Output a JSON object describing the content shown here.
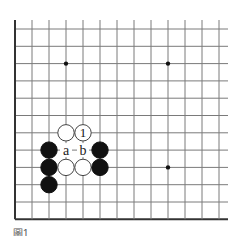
{
  "diagram": {
    "type": "go-board-fragment",
    "grid": {
      "columns": 13,
      "rows": 12,
      "x0": 15,
      "y0": 29,
      "dx": 17,
      "dy": 17.3,
      "open_right": true,
      "open_top": true,
      "line_color": "#7a7a7a",
      "edge_color": "#333333"
    },
    "star_points": [
      {
        "col": 3,
        "row": 2
      },
      {
        "col": 9,
        "row": 2
      },
      {
        "col": 9,
        "row": 8
      }
    ],
    "stones": [
      {
        "col": 3,
        "row": 6,
        "color": "white",
        "label": ""
      },
      {
        "col": 4,
        "row": 6,
        "color": "white",
        "label": "1"
      },
      {
        "col": 2,
        "row": 7,
        "color": "black",
        "label": ""
      },
      {
        "col": 5,
        "row": 7,
        "color": "black",
        "label": ""
      },
      {
        "col": 2,
        "row": 8,
        "color": "black",
        "label": ""
      },
      {
        "col": 3,
        "row": 8,
        "color": "white",
        "label": ""
      },
      {
        "col": 4,
        "row": 8,
        "color": "white",
        "label": ""
      },
      {
        "col": 5,
        "row": 8,
        "color": "black",
        "label": ""
      },
      {
        "col": 2,
        "row": 9,
        "color": "black",
        "label": ""
      }
    ],
    "point_labels": [
      {
        "col": 3,
        "row": 7,
        "text": "a"
      },
      {
        "col": 4,
        "row": 7,
        "text": "b"
      }
    ],
    "caption": "圖1"
  }
}
